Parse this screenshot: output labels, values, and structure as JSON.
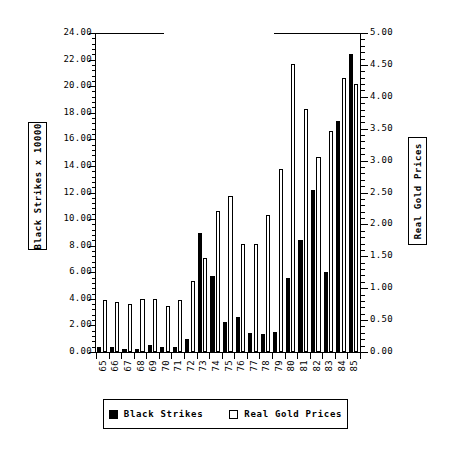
{
  "chart_data": {
    "type": "bar",
    "title": "",
    "subtitle": "",
    "xlabel": "",
    "ylabel": "Black Strikes x 10000",
    "y2label": "Real Gold Prices",
    "grid": false,
    "legend_position": "bottom",
    "categories": [
      "65",
      "66",
      "67",
      "68",
      "69",
      "70",
      "71",
      "72",
      "73",
      "74",
      "75",
      "76",
      "77",
      "78",
      "79",
      "80",
      "81",
      "82",
      "83",
      "84",
      "85"
    ],
    "ylim": [
      0,
      24
    ],
    "yticks": [
      "0.00",
      "2.00",
      "4.00",
      "6.00",
      "8.00",
      "10.00",
      "12.00",
      "14.00",
      "16.00",
      "18.00",
      "20.00",
      "22.00",
      "24.00"
    ],
    "ylim2": [
      0,
      5
    ],
    "y2ticks": [
      "0.00",
      "0.50",
      "1.00",
      "1.50",
      "2.00",
      "2.50",
      "3.00",
      "3.50",
      "4.00",
      "4.50",
      "5.00"
    ],
    "series": [
      {
        "name": "Black Strikes",
        "axis": "left",
        "color": "#000000",
        "values": [
          0.35,
          0.4,
          0.2,
          0.2,
          0.5,
          0.35,
          0.4,
          0.95,
          8.95,
          5.75,
          2.25,
          2.6,
          1.45,
          1.35,
          1.5,
          5.6,
          8.4,
          12.2,
          6.05,
          17.4,
          22.4
        ]
      },
      {
        "name": "Real Gold Prices",
        "axis": "right",
        "color": "#ffffff",
        "values": [
          0.82,
          0.79,
          0.75,
          0.83,
          0.83,
          0.72,
          0.82,
          1.12,
          1.48,
          2.21,
          2.44,
          1.69,
          1.69,
          2.15,
          2.87,
          4.52,
          3.8,
          3.05,
          3.46,
          4.3,
          4.2
        ]
      }
    ],
    "series_left_values_in_left_units": [
      0.35,
      0.4,
      0.2,
      0.2,
      0.5,
      0.35,
      0.4,
      0.95,
      8.95,
      5.75,
      2.25,
      2.6,
      1.45,
      1.35,
      1.5,
      5.6,
      8.4,
      12.2,
      6.05,
      17.4,
      22.4
    ],
    "series_right_values_in_left_units": [
      3.95,
      3.78,
      3.6,
      4.0,
      4.0,
      3.45,
      3.94,
      5.38,
      7.1,
      10.6,
      11.72,
      8.1,
      8.1,
      10.32,
      13.8,
      21.7,
      18.25,
      14.64,
      16.6,
      20.64,
      20.16
    ]
  },
  "axes": {
    "left_title": "Black Strikes x 10000",
    "right_title": "Real Gold Prices"
  },
  "legend": {
    "entries": [
      {
        "label": "Black Strikes",
        "swatch": "black"
      },
      {
        "label": "Real Gold Prices",
        "swatch": "white"
      }
    ]
  }
}
